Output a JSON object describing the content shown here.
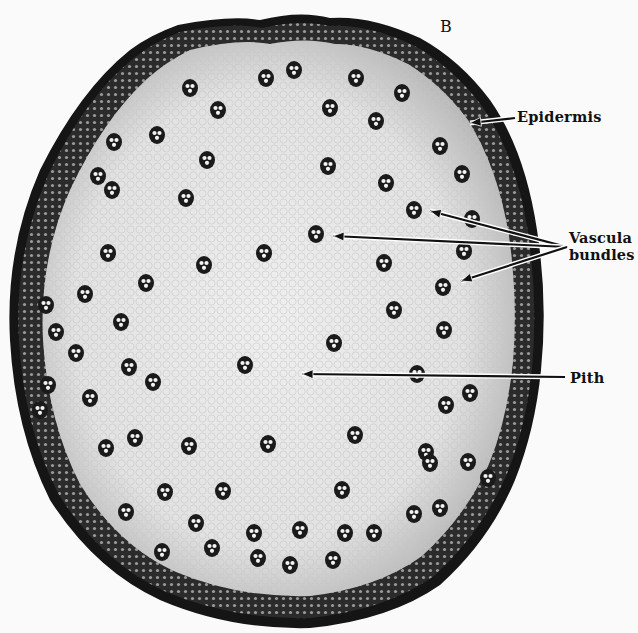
{
  "figure": {
    "panel_label": "B",
    "colors": {
      "background": "#fafafa",
      "epidermis": "#141414",
      "cortex_band": "#2a2a2a",
      "ground_tissue": "#e4e4e4",
      "pith": "#ececec",
      "bundle": "#1a1a1a",
      "bundle_vessel": "#f2f2f2",
      "arrow": "#111111"
    },
    "annotations": [
      {
        "id": "epidermis",
        "text": "Epidermis",
        "label_x": 517,
        "label_y": 113,
        "arrows": [
          [
            515,
            118,
            470,
            123
          ]
        ]
      },
      {
        "id": "vascular-bundles",
        "line1": "Vascula",
        "line2": "bundles",
        "label_x": 569,
        "label_y": 233,
        "arrows": [
          [
            567,
            247,
            430,
            211
          ],
          [
            567,
            247,
            333,
            236
          ],
          [
            567,
            247,
            461,
            281
          ]
        ]
      },
      {
        "id": "pith",
        "text": "Pith",
        "label_x": 570,
        "label_y": 370,
        "arrows": [
          [
            565,
            377,
            302,
            374
          ]
        ]
      }
    ],
    "bundles": [
      [
        266,
        78
      ],
      [
        218,
        110
      ],
      [
        330,
        108
      ],
      [
        157,
        135
      ],
      [
        376,
        121
      ],
      [
        207,
        160
      ],
      [
        114,
        142
      ],
      [
        98,
        176
      ],
      [
        328,
        166
      ],
      [
        386,
        183
      ],
      [
        186,
        198
      ],
      [
        414,
        210
      ],
      [
        316,
        234
      ],
      [
        264,
        253
      ],
      [
        204,
        265
      ],
      [
        108,
        253
      ],
      [
        146,
        283
      ],
      [
        384,
        263
      ],
      [
        464,
        251
      ],
      [
        85,
        294
      ],
      [
        443,
        287
      ],
      [
        121,
        322
      ],
      [
        394,
        310
      ],
      [
        444,
        330
      ],
      [
        334,
        343
      ],
      [
        76,
        353
      ],
      [
        129,
        367
      ],
      [
        245,
        365
      ],
      [
        153,
        382
      ],
      [
        417,
        374
      ],
      [
        48,
        385
      ],
      [
        90,
        398
      ],
      [
        470,
        393
      ],
      [
        446,
        405
      ],
      [
        106,
        448
      ],
      [
        135,
        438
      ],
      [
        189,
        446
      ],
      [
        268,
        444
      ],
      [
        355,
        435
      ],
      [
        40,
        410
      ],
      [
        426,
        452
      ],
      [
        430,
        463
      ],
      [
        468,
        462
      ],
      [
        488,
        478
      ],
      [
        342,
        490
      ],
      [
        223,
        491
      ],
      [
        165,
        492
      ],
      [
        126,
        512
      ],
      [
        196,
        523
      ],
      [
        254,
        533
      ],
      [
        300,
        530
      ],
      [
        345,
        533
      ],
      [
        374,
        533
      ],
      [
        414,
        514
      ],
      [
        440,
        508
      ],
      [
        162,
        552
      ],
      [
        212,
        548
      ],
      [
        258,
        558
      ],
      [
        290,
        565
      ],
      [
        333,
        560
      ],
      [
        56,
        332
      ],
      [
        46,
        305
      ],
      [
        440,
        146
      ],
      [
        462,
        174
      ],
      [
        294,
        70
      ],
      [
        356,
        78
      ],
      [
        190,
        88
      ],
      [
        402,
        93
      ],
      [
        112,
        190
      ],
      [
        472,
        219
      ]
    ]
  }
}
